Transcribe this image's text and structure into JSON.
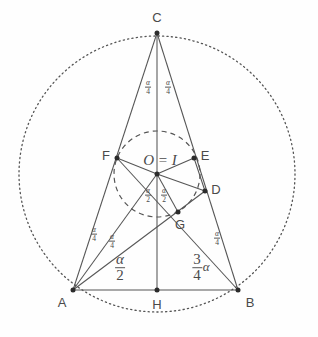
{
  "figure": {
    "type": "geometry-diagram",
    "colors": {
      "stroke": "#555555",
      "point": "#2b2b2b",
      "text": "#4a4a4a",
      "background": "#fefefe"
    },
    "canvas": {
      "width": 318,
      "height": 337
    }
  },
  "points": [
    {
      "id": "C",
      "label": "C",
      "x": 157,
      "y": 33,
      "label_x": 157,
      "label_y": 17
    },
    {
      "id": "A",
      "label": "A",
      "x": 73,
      "y": 290,
      "label_x": 62,
      "label_y": 302
    },
    {
      "id": "B",
      "label": "B",
      "x": 238,
      "y": 290,
      "label_x": 250,
      "label_y": 302
    },
    {
      "id": "H",
      "label": "H",
      "x": 157,
      "y": 290,
      "label_x": 157,
      "label_y": 304
    },
    {
      "id": "F",
      "label": "F",
      "x": 117,
      "y": 158,
      "label_x": 106,
      "label_y": 155
    },
    {
      "id": "E",
      "label": "E",
      "x": 194,
      "y": 158,
      "label_x": 205,
      "label_y": 155
    },
    {
      "id": "D",
      "label": "D",
      "x": 205,
      "y": 191,
      "label_x": 216,
      "label_y": 189
    },
    {
      "id": "G",
      "label": "G",
      "x": 178,
      "y": 212,
      "label_x": 180,
      "label_y": 224
    },
    {
      "id": "O",
      "label": "O = I",
      "x": 157,
      "y": 174,
      "label_x": 160,
      "label_y": 160
    }
  ],
  "circles": [
    {
      "id": "circumcircle",
      "cx": 157,
      "cy": 174,
      "r": 138,
      "style": "dotted"
    },
    {
      "id": "incircle",
      "cx": 157,
      "cy": 174,
      "r": 43,
      "style": "dashed"
    }
  ],
  "segments": [
    {
      "id": "side-AC",
      "from": "A",
      "to": "C"
    },
    {
      "id": "side-BC",
      "from": "B",
      "to": "C"
    },
    {
      "id": "side-AB",
      "from": "A",
      "to": "B"
    },
    {
      "id": "altitude-CH",
      "from": "C",
      "to": "H"
    },
    {
      "id": "cevian-AD",
      "from": "A",
      "to": "D"
    },
    {
      "id": "cevian-BF",
      "from": "B",
      "to": "F"
    },
    {
      "id": "radius-OF",
      "from": "O",
      "to": "F"
    },
    {
      "id": "radius-OE",
      "from": "O",
      "to": "E"
    },
    {
      "id": "radius-OD",
      "from": "O",
      "to": "D"
    },
    {
      "id": "radius-OG",
      "from": "O",
      "to": "G"
    },
    {
      "id": "segment-OA",
      "from": "O",
      "to": "A"
    },
    {
      "id": "segment-ED",
      "from": "E",
      "to": "D"
    }
  ],
  "angle_labels": [
    {
      "id": "alpha-over-4-C-left",
      "num": "α",
      "den": "4",
      "size": "small",
      "x": 148,
      "y": 87
    },
    {
      "id": "alpha-over-4-C-right",
      "num": "α",
      "den": "4",
      "size": "small",
      "x": 168,
      "y": 87
    },
    {
      "id": "alpha-over-2-O-left",
      "num": "α",
      "den": "2",
      "size": "small",
      "x": 148,
      "y": 195
    },
    {
      "id": "alpha-over-2-O-right",
      "num": "α",
      "den": "2",
      "size": "small",
      "x": 164,
      "y": 195
    },
    {
      "id": "alpha-over-4-A-upper",
      "num": "α",
      "den": "4",
      "size": "small",
      "x": 94,
      "y": 234
    },
    {
      "id": "alpha-over-4-A-lower",
      "num": "α",
      "den": "4",
      "size": "small",
      "x": 112,
      "y": 241
    },
    {
      "id": "alpha-over-4-B",
      "num": "α",
      "den": "4",
      "size": "small",
      "x": 217,
      "y": 238
    },
    {
      "id": "alpha-over-2-base",
      "num": "α",
      "den": "2",
      "size": "large",
      "x": 120,
      "y": 268
    },
    {
      "id": "three-quarters-alpha",
      "num": "3",
      "den": "4",
      "suffix": "α",
      "size": "large",
      "x": 201,
      "y": 268
    }
  ]
}
